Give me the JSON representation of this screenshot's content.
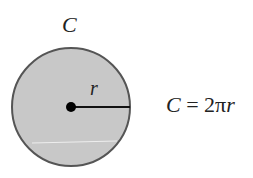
{
  "diagram": {
    "circle_label": "C",
    "radius_label": "r",
    "formula": {
      "lhs": "C",
      "equals": " = ",
      "coef": "2π",
      "var": "r"
    },
    "colors": {
      "fill": "#c8c8c8",
      "stroke": "#555555",
      "radius_line": "#111111",
      "center_dot": "#000000"
    }
  }
}
